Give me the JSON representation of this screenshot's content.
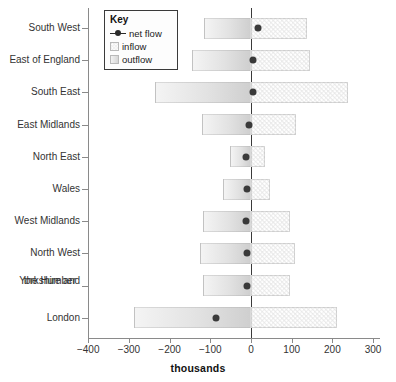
{
  "chart_data": {
    "type": "bar",
    "title": "",
    "subtitle": "",
    "xlabel": "thousands",
    "ylabel": "",
    "xlim": [
      -400,
      300
    ],
    "xticks": [
      -400,
      -300,
      -200,
      -100,
      0,
      100,
      200,
      300
    ],
    "xtick_labels": [
      "−400",
      "−300",
      "−200",
      "−100",
      "0",
      "100",
      "200",
      "300"
    ],
    "grid": false,
    "orientation": "horizontal",
    "zero_reference_line": 0,
    "legend_position": "top-left-inside",
    "categories": [
      "South West",
      "East of England",
      "South East",
      "East Midlands",
      "North East",
      "Wales",
      "West Midlands",
      "North West",
      "Yorkshire and the Humber",
      "London"
    ],
    "series": [
      {
        "name": "outflow",
        "values": [
          -115,
          -145,
          -235,
          -120,
          -52,
          -70,
          -118,
          -125,
          -118,
          -287
        ]
      },
      {
        "name": "inflow",
        "values": [
          137,
          145,
          238,
          110,
          35,
          47,
          96,
          108,
          96,
          211
        ]
      },
      {
        "name": "net flow",
        "values": [
          17,
          6,
          4,
          -5,
          -13,
          -11,
          -13,
          -9,
          -9,
          -86
        ]
      }
    ],
    "annotations": []
  },
  "legend": {
    "title": "Key",
    "items": [
      {
        "label": "net flow",
        "icon": "net-flow-marker-icon",
        "color": "#2b2b2b"
      },
      {
        "label": "inflow",
        "icon": "inflow-swatch-icon",
        "color": "#e4e4e4"
      },
      {
        "label": "outflow",
        "icon": "outflow-swatch-icon",
        "color": "#d6d6d6"
      }
    ]
  },
  "y_categories": [
    {
      "line1": "South West",
      "line2": ""
    },
    {
      "line1": "East of England",
      "line2": ""
    },
    {
      "line1": "South East",
      "line2": ""
    },
    {
      "line1": "East Midlands",
      "line2": ""
    },
    {
      "line1": "North East",
      "line2": ""
    },
    {
      "line1": "Wales",
      "line2": ""
    },
    {
      "line1": "West Midlands",
      "line2": ""
    },
    {
      "line1": "North West",
      "line2": ""
    },
    {
      "line1": "Yorkshire and",
      "line2": "the Humber"
    },
    {
      "line1": "London",
      "line2": ""
    }
  ],
  "axis": {
    "x_title": "thousands",
    "tick_labels": [
      "−400",
      "−300",
      "−200",
      "−100",
      "0",
      "100",
      "200",
      "300"
    ]
  }
}
